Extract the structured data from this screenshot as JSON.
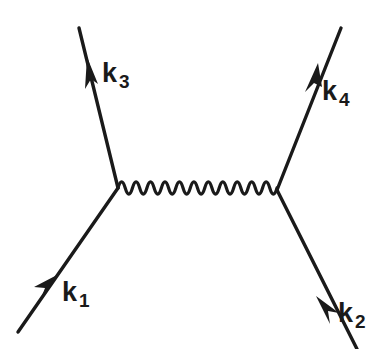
{
  "diagram": {
    "type": "feynman-diagram",
    "background_color": "#ffffff",
    "stroke_color": "#1a1a1a",
    "canvas": {
      "width": 389,
      "height": 349
    },
    "vertices": [
      {
        "name": "left-vertex",
        "x": 118,
        "y": 188
      },
      {
        "name": "right-vertex",
        "x": 277,
        "y": 190
      }
    ],
    "propagator": {
      "name": "photon-propagator",
      "style": "wavy",
      "x_start": 118,
      "x_end": 277,
      "y_center": 188,
      "amplitude": 9,
      "oscillations": 11
    },
    "fermion_lines": [
      {
        "name": "incoming-fermion-k1",
        "label": "k",
        "subscript": "1",
        "from": {
          "x": 18,
          "y": 332
        },
        "to": {
          "x": 118,
          "y": 188
        },
        "arrow_direction": "toward-vertex",
        "arrow_at": {
          "x": 50,
          "y": 286
        }
      },
      {
        "name": "incoming-fermion-k2",
        "label": "k",
        "subscript": "2",
        "from": {
          "x": 357,
          "y": 349
        },
        "to": {
          "x": 277,
          "y": 190
        },
        "arrow_direction": "toward-vertex",
        "arrow_at": {
          "x": 322,
          "y": 309
        }
      },
      {
        "name": "outgoing-fermion-k3",
        "label": "k",
        "subscript": "3",
        "from": {
          "x": 118,
          "y": 188
        },
        "to": {
          "x": 79,
          "y": 28
        },
        "arrow_direction": "away-from-vertex",
        "arrow_at": {
          "x": 93,
          "y": 84
        }
      },
      {
        "name": "outgoing-fermion-k4",
        "label": "k",
        "subscript": "4",
        "from": {
          "x": 277,
          "y": 190
        },
        "to": {
          "x": 341,
          "y": 28
        },
        "arrow_direction": "away-from-vertex",
        "arrow_at": {
          "x": 311,
          "y": 92
        }
      }
    ],
    "labels": {
      "k1": {
        "symbol": "k",
        "subscript": "1"
      },
      "k2": {
        "symbol": "k",
        "subscript": "2"
      },
      "k3": {
        "symbol": "k",
        "subscript": "3"
      },
      "k4": {
        "symbol": "k",
        "subscript": "4"
      }
    }
  }
}
